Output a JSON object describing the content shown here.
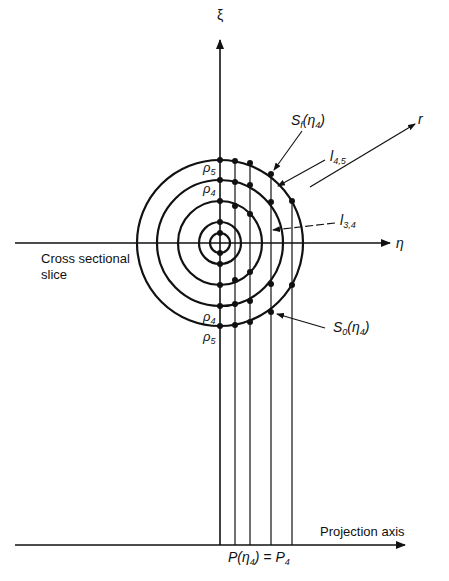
{
  "axes": {
    "vertical_label": "ξ",
    "horizontal_label": "η",
    "radial_label": "r",
    "projection_axis_label": "Projection axis"
  },
  "labels": {
    "cross_section": "Cross sectional",
    "cross_section_2": "slice",
    "rho5_top": "ρ",
    "rho5_sub": "5",
    "rho4_top": "ρ",
    "rho4_sub": "4",
    "rho4_bot": "ρ",
    "rho4_bot_sub": "4",
    "rho5_bot": "ρ",
    "rho5_bot_sub": "5",
    "sf": "S",
    "sf_sub": "f",
    "sf_arg": "(η",
    "sf_arg_sub": "4",
    "sf_close": ")",
    "s0": "S",
    "s0_sub": "0",
    "s0_arg": "(η",
    "s0_arg_sub": "4",
    "s0_close": ")",
    "l45": "l",
    "l45_sub": "4,5",
    "l34": "l",
    "l34_sub": "3,4",
    "projection_eq_a": "P(η",
    "projection_eq_sub1": "4",
    "projection_eq_b": ") = P",
    "projection_eq_sub2": "4"
  },
  "geometry": {
    "center": [
      220,
      243
    ],
    "circle_radii": [
      10,
      21,
      42,
      63,
      83
    ],
    "projection_lines_x": [
      220,
      235,
      250,
      271,
      292
    ]
  }
}
